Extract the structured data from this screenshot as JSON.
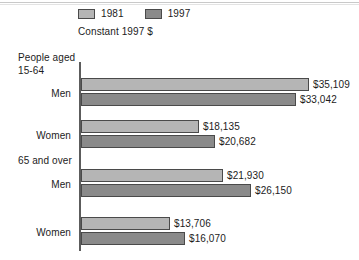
{
  "chart_data": {
    "type": "bar",
    "orientation": "horizontal",
    "title": "",
    "subtitle": "Constant 1997 $",
    "xlabel": "",
    "ylabel": "",
    "grid": false,
    "legend_position": "top-left",
    "xlim": [
      0,
      35109
    ],
    "legend": [
      {
        "name": "1981",
        "color": "#b5b5b5"
      },
      {
        "name": "1997",
        "color": "#8a8a8a"
      }
    ],
    "groups": [
      {
        "heading_line1": "People aged",
        "heading_line2": "15-64",
        "categories": [
          {
            "label": "Men",
            "bars": [
              {
                "series": "1981",
                "value": 35109,
                "value_label": "$35,109"
              },
              {
                "series": "1997",
                "value": 33042,
                "value_label": "$33,042"
              }
            ]
          },
          {
            "label": "Women",
            "bars": [
              {
                "series": "1981",
                "value": 18135,
                "value_label": "$18,135"
              },
              {
                "series": "1997",
                "value": 20682,
                "value_label": "$20,682"
              }
            ]
          }
        ]
      },
      {
        "heading_line1": "65 and over",
        "heading_line2": "",
        "categories": [
          {
            "label": "Men",
            "bars": [
              {
                "series": "1981",
                "value": 21930,
                "value_label": "$21,930"
              },
              {
                "series": "1997",
                "value": 26150,
                "value_label": "$26,150"
              }
            ]
          },
          {
            "label": "Women",
            "bars": [
              {
                "series": "1981",
                "value": 13706,
                "value_label": "$13,706"
              },
              {
                "series": "1997",
                "value": 16070,
                "value_label": "$16,070"
              }
            ]
          }
        ]
      }
    ],
    "categories": [
      "Men 15-64",
      "Women 15-64",
      "Men 65 and over",
      "Women 65 and over"
    ],
    "series": [
      {
        "name": "1981",
        "values": [
          35109,
          18135,
          21930,
          13706
        ]
      },
      {
        "name": "1997",
        "values": [
          33042,
          20682,
          26150,
          16070
        ]
      }
    ]
  },
  "colors": {
    "series_1981": "#b5b5b5",
    "series_1997": "#8a8a8a",
    "bar_outline": "#4a4a4a",
    "axis": "#5c5c5c",
    "text": "#1c1c1c",
    "background": "#ffffff"
  }
}
